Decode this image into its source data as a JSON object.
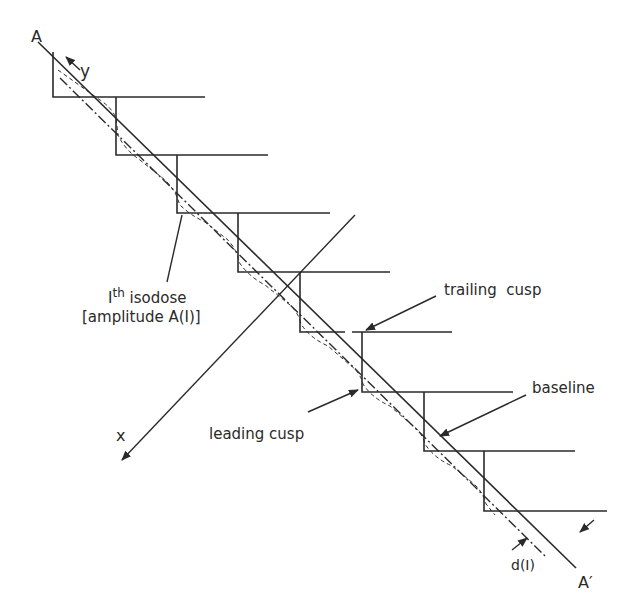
{
  "diagram": {
    "type": "staircase isodose geometry",
    "colors": {
      "ink": "#2a2a2a",
      "background": "#ffffff"
    },
    "labels": {
      "A": "A",
      "A_prime": "A′",
      "y_axis": "y",
      "x_axis": "x",
      "isodose_I": "I",
      "isodose_sup": "th",
      "isodose_word": "isodose",
      "isodose_amplitude": "[amplitude A(I)]",
      "trailing_cusp": "trailing  cusp",
      "leading_cusp": "leading cusp",
      "baseline": "baseline",
      "d_I": "d(I)"
    },
    "steps": [
      {
        "x": 53,
        "y_top": 52,
        "y": 97,
        "x_end": 205
      },
      {
        "x": 116,
        "y_top": 97,
        "y": 155,
        "x_end": 268
      },
      {
        "x": 177,
        "y_top": 155,
        "y": 213,
        "x_end": 330
      },
      {
        "x": 238,
        "y_top": 213,
        "y": 272,
        "x_end": 390
      },
      {
        "x": 300,
        "y_top": 272,
        "y": 332,
        "x_end": 452
      },
      {
        "x": 362,
        "y_top": 332,
        "y": 392,
        "x_end": 513
      },
      {
        "x": 424,
        "y_top": 392,
        "y": 451,
        "x_end": 575
      },
      {
        "x": 484,
        "y_top": 451,
        "y": 511,
        "x_end": 607
      }
    ]
  }
}
